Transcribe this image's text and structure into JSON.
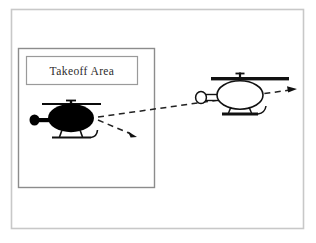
{
  "diagram": {
    "background_color": "#ffffff",
    "outer_frame": {
      "name": "outer-frame",
      "stroke_color": "#c8c8c8",
      "x": 11,
      "y": 9,
      "width": 293,
      "height": 220
    },
    "takeoff_area_box": {
      "name": "takeoff-area-box",
      "stroke_color": "#8c8c8c",
      "x": 18,
      "y": 48,
      "width": 137,
      "height": 140
    },
    "label_box": {
      "name": "takeoff-area-label-box",
      "stroke_color": "#9a9a9a",
      "text": "Takeoff  Area",
      "text_color": "#2b2b2b",
      "x": 26,
      "y": 56,
      "width": 112,
      "height": 29
    },
    "helicopters": [
      {
        "id": "black-helicopter",
        "label": "Takeoff helicopter",
        "style": "filled",
        "fill_color": "#000000",
        "stroke_color": "#000000",
        "facing": "left",
        "center_x": 71,
        "center_y": 118
      },
      {
        "id": "white-helicopter",
        "label": "Airborne helicopter",
        "style": "outline",
        "fill_color": "#ffffff",
        "stroke_color": "#1a1a1a",
        "facing": "left",
        "center_x": 240,
        "center_y": 96
      }
    ],
    "flight_paths": [
      {
        "id": "path-upper",
        "label": "Primary flight path",
        "style": "dashed",
        "stroke_color": "#222222",
        "from_x": 98,
        "from_y": 117,
        "to_x": 297,
        "to_y": 89,
        "arrowhead": "end"
      },
      {
        "id": "path-lower",
        "label": "Secondary flight path",
        "style": "dashed",
        "stroke_color": "#222222",
        "from_x": 98,
        "from_y": 120,
        "to_x": 136,
        "to_y": 136,
        "arrowhead": "end"
      }
    ]
  }
}
